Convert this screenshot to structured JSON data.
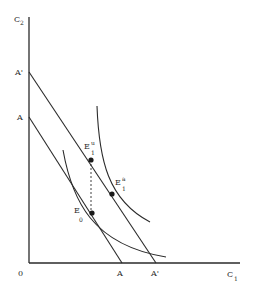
{
  "diagram": {
    "type": "economics-indifference-curve-diagram",
    "axes": {
      "y_label": "C",
      "y_label_sub": "2",
      "x_label": "C",
      "x_label_sub": "1",
      "origin_label": "0"
    },
    "budget_lines": [
      {
        "name": "A",
        "y_intercept_label": "A",
        "x_intercept_label": "A"
      },
      {
        "name": "A'",
        "y_intercept_label": "A'",
        "x_intercept_label": "A'"
      }
    ],
    "points": [
      {
        "name": "E1u",
        "label": "E",
        "sub": "1",
        "sup": "u"
      },
      {
        "name": "E1a",
        "label": "E",
        "sub": "1",
        "sup": "a"
      },
      {
        "name": "E0",
        "label": "E",
        "sub": "0",
        "sup": ""
      }
    ],
    "indifference_curves": [
      {
        "name": "upper",
        "tangent_point": "E1a"
      },
      {
        "name": "lower",
        "tangent_point": "E0"
      }
    ],
    "dashed_connector": {
      "from": "E1u",
      "to": "E0"
    },
    "colors": {
      "ink": "#2a2a2a",
      "background": "#ffffff"
    }
  }
}
